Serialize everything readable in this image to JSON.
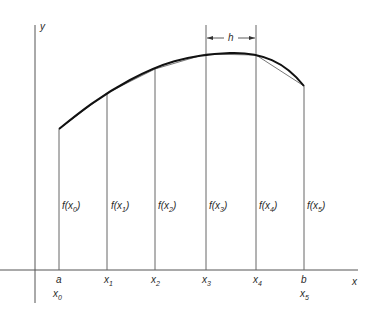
{
  "diagram": {
    "title": "",
    "axes": {
      "x_label": "x",
      "y_label": "y"
    },
    "interval": {
      "start_label": "a",
      "end_label": "b"
    },
    "step_label": "h",
    "nodes": [
      {
        "x_label": "x",
        "x_sub": "0",
        "extra_label": "a",
        "f_label_pre": "f(x",
        "f_sub": "0",
        "f_label_post": ")"
      },
      {
        "x_label": "x",
        "x_sub": "1",
        "f_label_pre": "f(x",
        "f_sub": "1",
        "f_label_post": ")"
      },
      {
        "x_label": "x",
        "x_sub": "2",
        "f_label_pre": "f(x",
        "f_sub": "2",
        "f_label_post": ")"
      },
      {
        "x_label": "x",
        "x_sub": "3",
        "f_label_pre": "f(x",
        "f_sub": "3",
        "f_label_post": ")"
      },
      {
        "x_label": "x",
        "x_sub": "4",
        "f_label_pre": "f(x",
        "f_sub": "4",
        "f_label_post": ")"
      },
      {
        "x_label": "x",
        "x_sub": "5",
        "extra_label": "b",
        "f_label_pre": "f(x",
        "f_sub": "5",
        "f_label_post": ")"
      }
    ],
    "colors": {
      "line": "#555555",
      "curve": "#111111",
      "text": "#2a2a2a"
    }
  }
}
